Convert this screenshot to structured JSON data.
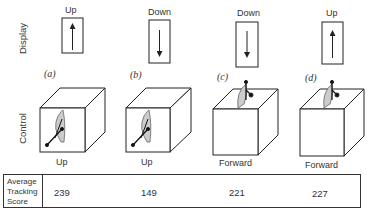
{
  "axis_labels": {
    "display": "Display",
    "control": "Control"
  },
  "conditions": [
    {
      "id": "(a)",
      "display_direction": "Up",
      "arrow": "up",
      "control_direction": "Up",
      "control_type": "side-lever",
      "score": "239"
    },
    {
      "id": "(b)",
      "display_direction": "Down",
      "arrow": "down",
      "control_direction": "Up",
      "control_type": "side-lever",
      "score": "149"
    },
    {
      "id": "(c)",
      "display_direction": "Down",
      "arrow": "down",
      "control_direction": "Forward",
      "control_type": "top-lever",
      "score": "221"
    },
    {
      "id": "(d)",
      "display_direction": "Up",
      "arrow": "up",
      "control_direction": "Forward",
      "control_type": "top-lever",
      "score": "227"
    }
  ],
  "table": {
    "row_header_line1": "Average",
    "row_header_line2": "Tracking",
    "row_header_line3": "Score"
  }
}
